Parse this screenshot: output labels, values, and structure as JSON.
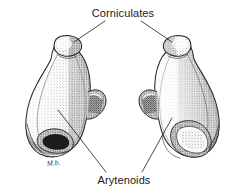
{
  "figure": {
    "title_alt": "Arytenoid and corniculate cartilages, paired posterior view",
    "background_color": "#ffffff",
    "ink_color": "#2a2a2a",
    "style": "stippled pen-and-ink anatomical illustration",
    "signature": "M.b."
  },
  "labels": {
    "corniculates": "Corniculates",
    "arytenoids": "Arytenoids"
  },
  "specimens": [
    {
      "name": "left-cartilage",
      "side": "left",
      "parts": [
        "corniculate apex",
        "body",
        "muscular process",
        "basal fossa"
      ]
    },
    {
      "name": "right-cartilage",
      "side": "right",
      "parts": [
        "corniculate apex",
        "body",
        "muscular process",
        "basal fossa"
      ]
    }
  ]
}
